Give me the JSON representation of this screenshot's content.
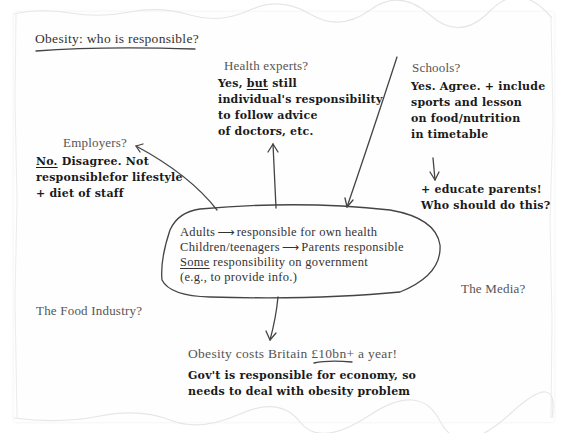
{
  "title": "Obesity: who is responsible?",
  "center": {
    "lines": [
      {
        "left": "Adults",
        "arrow": "⟶",
        "right": "responsible for own health"
      },
      {
        "left": "Children/teenagers",
        "arrow": "⟶",
        "right": "Parents responsible"
      },
      {
        "underlined": "Some",
        "rest": " responsibility on government"
      },
      {
        "text": "(e.g., to provide info.)"
      }
    ]
  },
  "nodes": {
    "health_experts": {
      "heading": "Health experts?",
      "line1_pre": "Yes, ",
      "line1_u": "but",
      "line1_post": " still",
      "line2": "individual's responsibility",
      "line3": "to follow advice",
      "line4": "of doctors, etc."
    },
    "schools": {
      "heading": "Schools?",
      "line1": "Yes. Agree. + include",
      "line2": "sports and lesson",
      "line3": "on food/nutrition",
      "line4": "in timetable",
      "extra1": "+ educate parents!",
      "extra2": "Who should do this?"
    },
    "employers": {
      "heading": "Employers?",
      "line1_u": "No.",
      "line1_post": " Disagree. Not",
      "line2": "responsiblefor lifestyle",
      "line3": "+ diet of staff"
    },
    "food_industry": {
      "heading": "The Food Industry?"
    },
    "media": {
      "heading": "The Media?"
    },
    "government": {
      "heading_pre": "Obesity costs Britain ",
      "heading_u": "£10bn+",
      "heading_post": " a year!",
      "line1": "Gov't is responsible for economy, so",
      "line2": "needs to deal with obesity problem"
    }
  },
  "colors": {
    "ink": "#333333",
    "heading": "#555555",
    "paper": "#fefefe"
  }
}
